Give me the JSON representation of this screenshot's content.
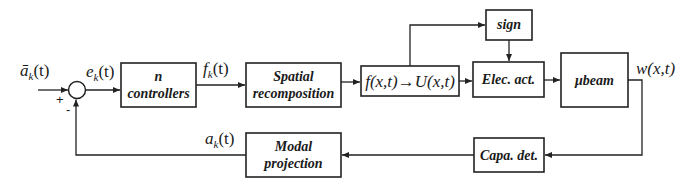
{
  "diagram": {
    "type": "block-diagram",
    "colors": {
      "stroke": "#222222",
      "background": "#ffffff",
      "text": "#1a1a1a"
    },
    "signals": {
      "reference": "ā",
      "reference_sub": "k",
      "reference_arg": "(t)",
      "error": "e",
      "error_sub": "k",
      "error_arg": "(t)",
      "force": "f",
      "force_sub": "k",
      "force_arg": "(t)",
      "output": "w(x,t)",
      "feedback": "a",
      "feedback_sub": "k",
      "feedback_arg": "(t)"
    },
    "summing_junction": {
      "plus": "+",
      "minus": "-"
    },
    "blocks": {
      "controllers": {
        "line1": "n",
        "line2": "controllers"
      },
      "spatial": {
        "line1": "Spatial",
        "line2": "recomposition"
      },
      "conversion": {
        "label": "f(x,t)→U(x,t)"
      },
      "sign": {
        "label": "sign"
      },
      "elec_act": {
        "label": "Elec. act."
      },
      "beam": {
        "label": "μbeam"
      },
      "capa_det": {
        "label": "Capa. det."
      },
      "modal": {
        "line1": "Modal",
        "line2": "projection"
      }
    }
  }
}
